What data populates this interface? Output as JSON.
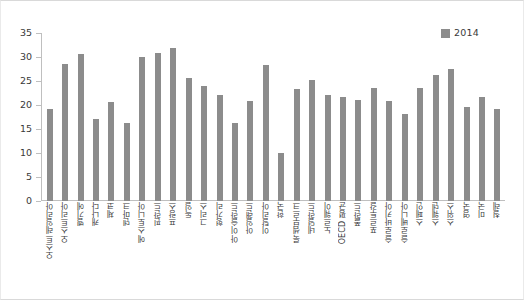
{
  "chart_data": {
    "type": "bar",
    "title": "",
    "xlabel": "",
    "ylabel": "",
    "ylim": [
      0,
      35
    ],
    "ytick_labels": [
      "35",
      "30",
      "25",
      "20",
      "15",
      "10",
      "5",
      "0"
    ],
    "ytick_values": [
      35,
      30,
      25,
      20,
      15,
      10,
      5,
      0
    ],
    "grid": false,
    "legend": {
      "position": "top-right",
      "entries": [
        {
          "label": "2014",
          "color": "#8c8c8c"
        }
      ]
    },
    "series": [
      {
        "name": "2014",
        "color": "#8c8c8c",
        "values": [
          19.1,
          28.5,
          30.7,
          17.0,
          20.6,
          16.2,
          30.1,
          30.9,
          31.8,
          25.7,
          24.0,
          22.0,
          16.3,
          20.8,
          28.4,
          10.0,
          23.4,
          25.3,
          22.1,
          21.7,
          21.1,
          23.5,
          20.8,
          18.1,
          23.5,
          26.2,
          27.4,
          19.6,
          21.6,
          19.1
        ]
      }
    ],
    "categories": [
      "오스트레일리아",
      "오스트리아",
      "벨기에",
      "캐나다",
      "체코",
      "덴마크",
      "에스토니아",
      "핀란드",
      "프랑스",
      "독일",
      "그리스",
      "헝가리",
      "아이슬란드",
      "아일랜드",
      "이탈리아",
      "한국",
      "룩셈부르크",
      "네덜란드",
      "노르웨이",
      "OECD 평균",
      "폴란드",
      "포르투갈",
      "슬로바키아",
      "슬로베니아",
      "스페인",
      "스웨덴",
      "스위스",
      "영국",
      "미국",
      "칠레"
    ]
  }
}
